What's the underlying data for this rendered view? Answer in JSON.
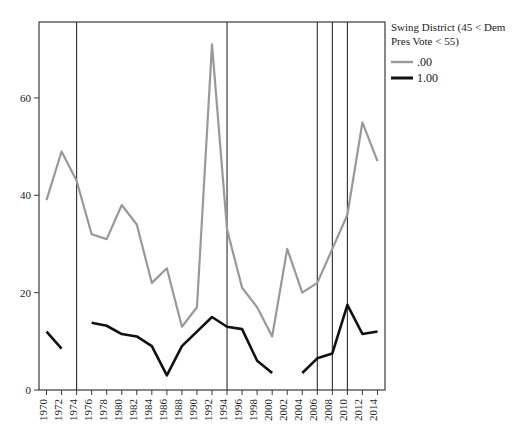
{
  "chart_data": {
    "type": "line",
    "title": "",
    "xlabel": "",
    "ylabel": "",
    "xlim": [
      1969,
      2015
    ],
    "ylim": [
      0,
      75
    ],
    "grid": false,
    "legend_position": "top-right-outside",
    "y_ticks": [
      0,
      20,
      40,
      60
    ],
    "x_ticks": [
      1970,
      1972,
      1974,
      1976,
      1978,
      1980,
      1982,
      1984,
      1986,
      1988,
      1990,
      1992,
      1994,
      1996,
      1998,
      2000,
      2002,
      2004,
      2006,
      2008,
      2010,
      2012,
      2014
    ],
    "x_tick_labels": [
      "1970",
      "1972",
      "1974",
      "1976",
      "1978",
      "1980",
      "1982",
      "1984",
      "1986",
      "1988",
      "1990",
      "1992",
      "1994",
      "1996",
      "1998",
      "2000",
      "2002",
      "2004",
      "2006",
      "2008",
      "2010",
      "2012",
      "2014"
    ],
    "y_tick_labels": [
      "0",
      "20",
      "40",
      "60"
    ],
    "reference_lines": [
      1974,
      1994,
      2006,
      2008,
      2010
    ],
    "series": [
      {
        "name": ".00",
        "color": "#999999",
        "width": 2.2,
        "x": [
          1970,
          1972,
          1974,
          1976,
          1978,
          1980,
          1982,
          1984,
          1986,
          1988,
          1990,
          1992,
          1994,
          1996,
          1998,
          2000,
          2002,
          2004,
          2006,
          2008,
          2010,
          2012,
          2014
        ],
        "values": [
          39,
          49,
          43,
          32,
          31,
          38,
          34,
          22,
          25,
          13,
          17,
          71,
          33,
          21,
          17,
          11,
          29,
          20,
          22,
          29,
          36,
          55,
          47
        ]
      },
      {
        "name": "1.00",
        "color": "#111111",
        "width": 2.6,
        "x": [
          1970,
          1972,
          1976,
          1978,
          1980,
          1982,
          1984,
          1986,
          1988,
          1990,
          1992,
          1994,
          1996,
          1998,
          2000,
          2004,
          2006,
          2008,
          2010,
          2012,
          2014
        ],
        "values": [
          12,
          8.5,
          13.8,
          13.2,
          11.5,
          11,
          9,
          3,
          9,
          12,
          15,
          13,
          12.5,
          6,
          3.5,
          3.5,
          6.5,
          7.5,
          17.5,
          11.5,
          12
        ],
        "segments": [
          [
            1970,
            1972
          ],
          [
            1976,
            2000
          ],
          [
            2004,
            2014
          ]
        ]
      }
    ]
  },
  "legend": {
    "title_line1": "Swing District (45 < Dem",
    "title_line2": "Pres Vote < 55)",
    "entries": [
      {
        "label": ".00",
        "color": "#999999"
      },
      {
        "label": "1.00",
        "color": "#111111"
      }
    ]
  }
}
